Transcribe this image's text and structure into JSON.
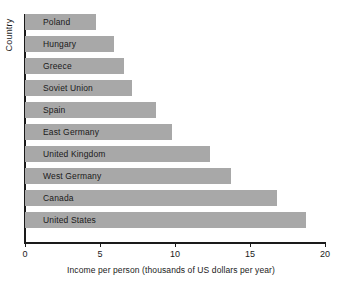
{
  "chart_data": {
    "type": "bar",
    "orientation": "horizontal",
    "title": "",
    "xlabel": "Income per person (thousands of US dollars per year)",
    "ylabel": "Country",
    "categories": [
      "Poland",
      "Hungary",
      "Greece",
      "Soviet Union",
      "Spain",
      "East Germany",
      "United Kingdom",
      "West Germany",
      "Canada",
      "United States"
    ],
    "values": [
      4.7,
      5.9,
      6.6,
      7.1,
      8.7,
      9.8,
      12.3,
      13.7,
      16.8,
      18.7
    ],
    "xlim": [
      0,
      20
    ],
    "xticks": [
      0,
      5,
      10,
      15,
      20
    ],
    "xtick_labels": [
      "0",
      "5",
      "10",
      "15",
      "20"
    ],
    "grid": false,
    "legend": null,
    "bar_color": "#a8a8a8",
    "axis_color": "#1a1a1a",
    "background_color": "#ffffff"
  },
  "axes": {
    "y_title": "Country",
    "x_title": "Income per person (thousands of US dollars per year)"
  }
}
